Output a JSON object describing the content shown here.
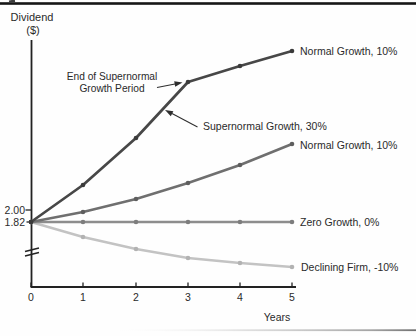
{
  "figure": {
    "y_axis_title_line1": "Dividend",
    "y_axis_title_line2": "($)",
    "x_axis_label": "Years",
    "y_tick_labels": [
      "2.00",
      "1.82"
    ],
    "x_tick_labels": [
      "0",
      "1",
      "2",
      "3",
      "4",
      "5"
    ]
  },
  "annotations": {
    "end_supernormal_line1": "End of Supernormal",
    "end_supernormal_line2": "Growth Period",
    "supernormal_label": "Supernormal Growth, 30%"
  },
  "chart_data": {
    "type": "line",
    "xlabel": "Years",
    "ylabel": "Dividend ($)",
    "x": [
      0,
      1,
      2,
      3,
      4,
      5
    ],
    "xlim": [
      0,
      5
    ],
    "y_axis_reference_values": [
      2.0,
      1.82
    ],
    "y_axis_break_below": 1.82,
    "grid": false,
    "legend_position": "inline-right",
    "series": [
      {
        "name": "supernormal-then-normal-growth",
        "label": "Normal Growth, 10%",
        "description": "Supernormal Growth, 30% for years 0-3, then Normal Growth, 10%",
        "values": [
          1.82,
          2.37,
          3.08,
          4.0,
          4.4,
          4.84
        ],
        "color": "#474747",
        "marker_color": "#3a3a3a"
      },
      {
        "name": "normal-growth",
        "label": "Normal Growth, 10%",
        "values": [
          1.82,
          2.0,
          2.2,
          2.42,
          2.66,
          2.93
        ],
        "color": "#6f6f6f",
        "marker_color": "#5e5e5e"
      },
      {
        "name": "zero-growth",
        "label": "Zero Growth, 0%",
        "values": [
          1.82,
          1.82,
          1.82,
          1.82,
          1.82,
          1.82
        ],
        "color": "#8d8d8d",
        "marker_color": "#7d7d7d"
      },
      {
        "name": "declining-firm",
        "label": "Declining Firm, -10%",
        "values": [
          1.82,
          1.64,
          1.47,
          1.33,
          1.19,
          1.08
        ],
        "color": "#c3c3c3",
        "marker_color": "#b2b2b2"
      }
    ]
  },
  "layout": {
    "x_px": [
      31,
      83,
      136,
      188,
      240,
      292
    ],
    "series_y_px": [
      [
        222,
        185,
        138,
        82,
        66,
        51
      ],
      [
        222,
        212,
        199,
        183,
        165,
        144
      ],
      [
        222,
        222,
        222,
        222,
        222,
        222
      ],
      [
        222,
        237,
        249,
        258,
        263,
        267
      ]
    ],
    "stroke_widths": [
      2.7,
      2.6,
      2.4,
      2.4
    ],
    "marker_radius": 2.3,
    "x_axis_y": 287,
    "tick_len": 4.5
  }
}
